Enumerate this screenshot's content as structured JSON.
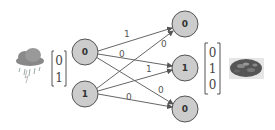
{
  "diagram": {
    "input_icon": "rain-cloud-icon",
    "output_icon": "food-dish-image",
    "input_vector": [
      "0",
      "1"
    ],
    "output_vector": [
      "0",
      "1",
      "0"
    ],
    "input_nodes": [
      {
        "label": "0"
      },
      {
        "label": "1"
      }
    ],
    "output_nodes": [
      {
        "label": "0"
      },
      {
        "label": "1"
      },
      {
        "label": "0"
      }
    ],
    "edge_weights": {
      "in0_out0": "1",
      "in0_out1": "0",
      "in0_out2": "",
      "in1_out0": "0",
      "in1_out1": "1",
      "in1_out2": "0",
      "in0_out2_label": "0"
    },
    "colors": {
      "node_fill": "#cccccc",
      "node_stroke": "#555555",
      "edge": "#666666"
    }
  }
}
